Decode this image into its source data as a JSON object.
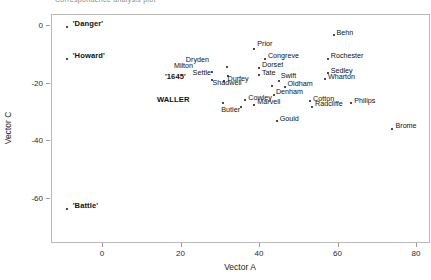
{
  "caption": {
    "text": "Correspondence analysis plot"
  },
  "axes": {
    "xlabel": "Vector A",
    "ylabel": "Vector C",
    "xticks": [
      {
        "label": "0",
        "value": 0
      },
      {
        "label": "20",
        "value": 20
      },
      {
        "label": "40",
        "value": 40
      },
      {
        "label": "60",
        "value": 60
      },
      {
        "label": "80",
        "value": 80
      }
    ],
    "yticks": [
      {
        "label": "0",
        "value": 0
      },
      {
        "label": "-20",
        "value": -20
      },
      {
        "label": "-40",
        "value": -40
      },
      {
        "label": "-60",
        "value": -60
      }
    ],
    "xlim": [
      -13,
      80
    ],
    "ylim": [
      -73,
      3.5
    ],
    "grid": false,
    "frame_color": "#b9b9b9"
  },
  "chart_data": {
    "type": "scatter",
    "title": "",
    "xlabel": "Vector A",
    "ylabel": "Vector C",
    "xlim": [
      -13,
      80
    ],
    "ylim": [
      -73,
      3.5
    ],
    "grid": false,
    "legend": "none",
    "marker_color": "#111111",
    "points": [
      {
        "label": "'Danger'",
        "x": -9.0,
        "y": -0.6,
        "bold": true,
        "label_dx": 6,
        "label_dy": -3
      },
      {
        "label": "'Howard'",
        "x": -9.0,
        "y": -11.7,
        "bold": true,
        "label_dx": 6,
        "label_dy": -3
      },
      {
        "label": "'Battle'",
        "x": -9.0,
        "y": -64.1,
        "bold": true,
        "label_dx": 6,
        "label_dy": -3
      },
      {
        "label": "'1645'",
        "x": 28.0,
        "y": -19.0,
        "bold": true,
        "label_dx": -26,
        "label_dy": -3
      },
      {
        "label": "WALLER",
        "x": 30.8,
        "y": -27.0,
        "bold": true,
        "label_dx": -33,
        "label_dy": -3
      },
      {
        "label": "Milton",
        "x": 28.0,
        "y": -16.4,
        "bold": false,
        "label_dx": -19,
        "label_dy": -7
      },
      {
        "label": "Dryden",
        "x": 31.8,
        "y": -14.5,
        "bold": false,
        "label_dx": -18,
        "label_dy": -7
      },
      {
        "label": "Settle",
        "x": 32.0,
        "y": -17.7,
        "bold": false,
        "label_dx": -17,
        "label_dy": -3
      },
      {
        "label": "Durfey",
        "x": 31.2,
        "y": -19.6,
        "bold": false,
        "label_dx": 3,
        "label_dy": -3
      },
      {
        "label": "Prior",
        "x": 38.8,
        "y": -8.5,
        "bold": false,
        "label_dx": 3,
        "label_dy": -6
      },
      {
        "label": "Congreve",
        "x": 41.5,
        "y": -11.7,
        "bold": false,
        "label_dx": 3,
        "label_dy": -3
      },
      {
        "label": "Dorset",
        "x": 40.0,
        "y": -14.8,
        "bold": false,
        "label_dx": 3,
        "label_dy": -3
      },
      {
        "label": "Tate",
        "x": 40.0,
        "y": -17.4,
        "bold": false,
        "label_dx": 3,
        "label_dy": -3
      },
      {
        "label": "Shadwell",
        "x": 43.2,
        "y": -21.1,
        "bold": false,
        "label_dx": -30,
        "label_dy": -3
      },
      {
        "label": "Swift",
        "x": 45.0,
        "y": -19.6,
        "bold": false,
        "label_dx": 2,
        "label_dy": -6
      },
      {
        "label": "Oldham",
        "x": 46.5,
        "y": -21.4,
        "bold": false,
        "label_dx": 3,
        "label_dy": -3
      },
      {
        "label": "Denham",
        "x": 43.8,
        "y": -24.3,
        "bold": false,
        "label_dx": 2,
        "label_dy": -3
      },
      {
        "label": "Cowley",
        "x": 36.5,
        "y": -26.2,
        "bold": false,
        "label_dx": 3,
        "label_dy": -3
      },
      {
        "label": "Marvell",
        "x": 38.8,
        "y": -27.8,
        "bold": false,
        "label_dx": 3,
        "label_dy": -3
      },
      {
        "label": "Butler",
        "x": 35.5,
        "y": -28.5,
        "bold": false,
        "label_dx": -1,
        "label_dy": 3
      },
      {
        "label": "Cotton",
        "x": 53.0,
        "y": -26.5,
        "bold": false,
        "label_dx": 3,
        "label_dy": -3
      },
      {
        "label": "Radcliffe",
        "x": 53.5,
        "y": -28.5,
        "bold": false,
        "label_dx": 3,
        "label_dy": -3
      },
      {
        "label": "Gould",
        "x": 44.5,
        "y": -33.5,
        "bold": false,
        "label_dx": 3,
        "label_dy": -3
      },
      {
        "label": "Philips",
        "x": 63.5,
        "y": -27.2,
        "bold": false,
        "label_dx": 3,
        "label_dy": -3
      },
      {
        "label": "Behn",
        "x": 59.0,
        "y": -3.5,
        "bold": false,
        "label_dx": 3,
        "label_dy": -3
      },
      {
        "label": "Rochester",
        "x": 57.5,
        "y": -11.7,
        "bold": false,
        "label_dx": 3,
        "label_dy": -3
      },
      {
        "label": "Sedley",
        "x": 57.5,
        "y": -16.7,
        "bold": false,
        "label_dx": 3,
        "label_dy": -3
      },
      {
        "label": "Wharton",
        "x": 56.8,
        "y": -18.8,
        "bold": false,
        "label_dx": 3,
        "label_dy": -3
      },
      {
        "label": "Brome",
        "x": 74.0,
        "y": -36.0,
        "bold": false,
        "label_dx": 3,
        "label_dy": -3
      }
    ]
  }
}
